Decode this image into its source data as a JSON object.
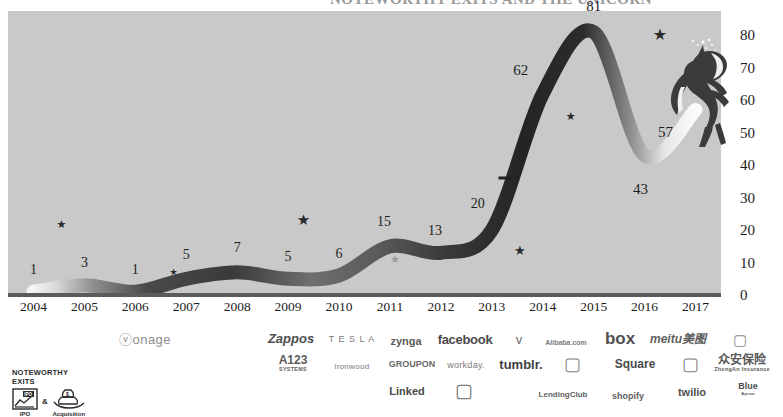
{
  "title": {
    "text": "NOTEWORTHY EXITS AND THE UNICORN"
  },
  "chart_data": {
    "type": "line",
    "title": "",
    "xlabel": "",
    "ylabel": "",
    "grid": false,
    "legend_position": "bottom-left",
    "ylim": [
      0,
      85
    ],
    "yticks": [
      0,
      10,
      20,
      30,
      40,
      50,
      60,
      70,
      80
    ],
    "categories": [
      "2004",
      "2005",
      "2006",
      "2007",
      "2008",
      "2009",
      "2010",
      "2011",
      "2012",
      "2013",
      "2014",
      "2015",
      "2016",
      "2017"
    ],
    "values": [
      1,
      3,
      1,
      5,
      7,
      5,
      6,
      15,
      13,
      20,
      62,
      81,
      43,
      57
    ],
    "point_labels": [
      "1",
      "3",
      "1",
      "5",
      "7",
      "5",
      "6",
      "15",
      "13",
      "20",
      "62",
      "81",
      "43",
      "57"
    ],
    "series": [
      {
        "name": "Unicorn count",
        "values": [
          1,
          3,
          1,
          5,
          7,
          5,
          6,
          15,
          13,
          20,
          62,
          81,
          43,
          57
        ]
      }
    ],
    "exit_markers": [
      {
        "kind": "ipo",
        "x_year": 2004.55,
        "y": 22,
        "size": 11,
        "shade": "dark"
      },
      {
        "kind": "acquisition",
        "x_year": 2006.75,
        "y": 7,
        "size": 9,
        "shade": "dark"
      },
      {
        "kind": "ipo",
        "x_year": 2009.3,
        "y": 23,
        "size": 15,
        "shade": "dark"
      },
      {
        "kind": "acquisition",
        "x_year": 2011.1,
        "y": 11,
        "size": 11,
        "shade": "light"
      },
      {
        "kind": "ipo",
        "x_year": 2013.55,
        "y": 14,
        "size": 13,
        "shade": "dark"
      },
      {
        "kind": "ipo",
        "x_year": 2014.55,
        "y": 55,
        "size": 11,
        "shade": "dark"
      },
      {
        "kind": "ipo",
        "x_year": 2016.3,
        "y": 80,
        "size": 16,
        "shade": "dark"
      }
    ],
    "dash_marker": {
      "x_year": 2013.25,
      "y": 36
    }
  },
  "y_axis": {
    "ticks": [
      "0",
      "10",
      "20",
      "30",
      "40",
      "50",
      "60",
      "70",
      "80"
    ]
  },
  "x_axis": {
    "ticks": [
      "2004",
      "2005",
      "2006",
      "2007",
      "2008",
      "2009",
      "2010",
      "2011",
      "2012",
      "2013",
      "2014",
      "2015",
      "2016",
      "2017"
    ]
  },
  "legend": {
    "heading_line1": "NOTEWORTHY",
    "heading_line2": "EXITS",
    "ipo_label": "IPO",
    "ipo_icon_text": "IPO",
    "ampersand": "&",
    "acquisition_label": "Acquisition"
  },
  "colors": {
    "plot_background": "#c9c9c9",
    "line_dark": "#2f2f2f",
    "line_mid": "#6a6a6a",
    "line_light": "#f2f2f2",
    "axis": "#5b5b5b",
    "text": "#1c1c1c",
    "logo_gray": "#6d6d6d"
  },
  "logos": {
    "row1": [
      {
        "name": "vonage",
        "text": "ⓥonage",
        "x": 145,
        "y": 13,
        "size": 13,
        "weight": "normal",
        "letter_spacing": "0.5px",
        "color": "#8d8d8d",
        "style": "normal"
      },
      {
        "name": "zappos",
        "text": "Zappos",
        "x": 291,
        "y": 12,
        "size": 13,
        "weight": "bold",
        "letter_spacing": "0px",
        "color": "#4f4f4f",
        "style": "italic"
      },
      {
        "name": "tesla",
        "text": "T E S L A",
        "x": 352,
        "y": 13,
        "size": 9,
        "weight": "normal",
        "letter_spacing": "1px",
        "color": "#7b7b7b",
        "style": "normal"
      },
      {
        "name": "zynga",
        "text": "zynga",
        "x": 406,
        "y": 15,
        "size": 11,
        "weight": "bold",
        "letter_spacing": "0px",
        "color": "#5a5a5a",
        "style": "normal"
      },
      {
        "name": "facebook",
        "text": "facebook",
        "x": 465,
        "y": 13,
        "size": 13,
        "weight": "bold",
        "letter_spacing": "-0.3px",
        "color": "#4a4a4a",
        "style": "normal"
      },
      {
        "name": "twitter",
        "text": "ᴠ",
        "x": 519,
        "y": 13,
        "size": 13,
        "weight": "normal",
        "letter_spacing": "0px",
        "color": "#6d6d6d",
        "style": "normal"
      },
      {
        "name": "alibaba",
        "text": "Alibaba.com",
        "x": 566,
        "y": 16,
        "size": 7,
        "weight": "bold",
        "letter_spacing": "0px",
        "color": "#7d7d7d",
        "style": "normal"
      },
      {
        "name": "box",
        "text": "box",
        "x": 620,
        "y": 12,
        "size": 17,
        "weight": "bold",
        "letter_spacing": "0px",
        "color": "#4f4f4f",
        "style": "normal"
      },
      {
        "name": "meitu",
        "text": "meitu美图",
        "x": 678,
        "y": 13,
        "size": 12,
        "weight": "bold",
        "letter_spacing": "0px",
        "color": "#5f5f5f",
        "style": "italic"
      },
      {
        "name": "snapchat",
        "text": "▢",
        "x": 740,
        "y": 13,
        "size": 15,
        "weight": "normal",
        "letter_spacing": "0px",
        "color": "#8a8a8a",
        "style": "normal"
      }
    ],
    "row2": [
      {
        "name": "a123-systems",
        "text": "A123",
        "x": 293,
        "y": 37,
        "size": 12,
        "weight": "bold",
        "letter_spacing": "0px",
        "color": "#5c5c5c",
        "style": "normal",
        "sub": "SYSTEMS"
      },
      {
        "name": "ironwood",
        "text": "ironwood",
        "x": 352,
        "y": 41,
        "size": 8,
        "weight": "normal",
        "letter_spacing": "0.3px",
        "color": "#7a7a7a",
        "style": "normal"
      },
      {
        "name": "groupon",
        "text": "GROUPON",
        "x": 412,
        "y": 38,
        "size": 9,
        "weight": "bold",
        "letter_spacing": "0px",
        "color": "#6a6a6a",
        "style": "normal"
      },
      {
        "name": "workday",
        "text": "workday.",
        "x": 466,
        "y": 39,
        "size": 9,
        "weight": "normal",
        "letter_spacing": "0.3px",
        "color": "#7a7a7a",
        "style": "normal"
      },
      {
        "name": "tumblr",
        "text": "tumblr.",
        "x": 521,
        "y": 38,
        "size": 13,
        "weight": "bold",
        "letter_spacing": "0px",
        "color": "#3f3f3f",
        "style": "normal"
      },
      {
        "name": "whatsapp",
        "text": "▢",
        "x": 572,
        "y": 38,
        "size": 18,
        "weight": "normal",
        "letter_spacing": "0px",
        "color": "#7e7e7e",
        "style": "normal"
      },
      {
        "name": "square",
        "text": "Square",
        "x": 635,
        "y": 38,
        "size": 12,
        "weight": "bold",
        "letter_spacing": "0px",
        "color": "#4a4a4a",
        "style": "normal"
      },
      {
        "name": "gojek",
        "text": "▢",
        "x": 690,
        "y": 38,
        "size": 18,
        "weight": "normal",
        "letter_spacing": "0px",
        "color": "#7e7e7e",
        "style": "normal"
      },
      {
        "name": "zhongan",
        "text": "众安保险",
        "x": 742,
        "y": 37,
        "size": 12,
        "weight": "bold",
        "letter_spacing": "0px",
        "color": "#5a5a5a",
        "style": "normal",
        "sub": "ZhongAn Insurance"
      }
    ],
    "row3": [
      {
        "name": "linkedin",
        "text": "Linked",
        "x": 407,
        "y": 65,
        "size": 11,
        "weight": "bold",
        "letter_spacing": "0px",
        "color": "#4a4a4a",
        "style": "normal"
      },
      {
        "name": "instagram",
        "text": "▢",
        "x": 464,
        "y": 64,
        "size": 19,
        "weight": "normal",
        "letter_spacing": "0px",
        "color": "#6d6d6d",
        "style": "normal"
      },
      {
        "name": "lendingclub",
        "text": "LendingClub",
        "x": 563,
        "y": 69,
        "size": 8,
        "weight": "bold",
        "letter_spacing": "0px",
        "color": "#5f5f5f",
        "style": "normal"
      },
      {
        "name": "shopify",
        "text": "shopify",
        "x": 628,
        "y": 70,
        "size": 9,
        "weight": "bold",
        "letter_spacing": "0px",
        "color": "#5f5f5f",
        "style": "normal"
      },
      {
        "name": "twilio",
        "text": "twilio",
        "x": 692,
        "y": 66,
        "size": 11,
        "weight": "bold",
        "letter_spacing": "0px",
        "color": "#4f4f4f",
        "style": "normal"
      },
      {
        "name": "blue-apron",
        "text": "Blue",
        "x": 748,
        "y": 63,
        "size": 9,
        "weight": "bold",
        "letter_spacing": "0px",
        "color": "#4f4f4f",
        "style": "normal",
        "sub": "Apron"
      }
    ]
  }
}
